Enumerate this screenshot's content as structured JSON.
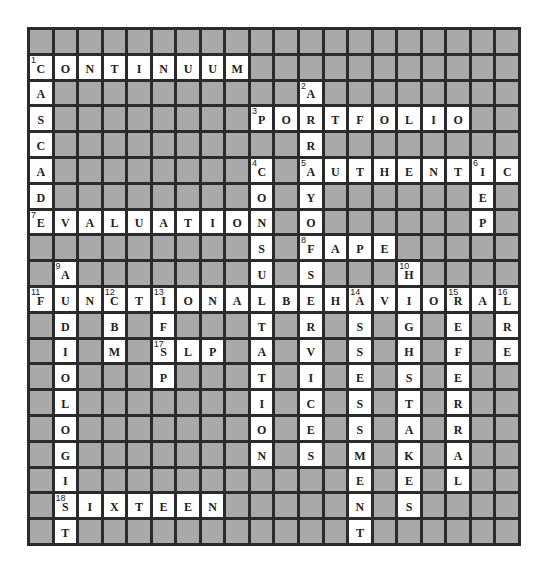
{
  "puzzle": {
    "rows": 20,
    "cols": 20,
    "colors": {
      "block": "#a9a9a9",
      "open": "#ffffff",
      "border": "#2b2b2b",
      "text": "#222222"
    },
    "grid": [
      "####################",
      "CONTINUUM###########",
      "A##########A########",
      "S########PORTFOLIO##",
      "C##########R########",
      "A########C#AUTHENTIC",
      "D########O#Y######E#",
      "EVALUATION#O######P#",
      "#########S#FAPE#####",
      "#A#######U#S###H####",
      "FUNCTIONALBEHAVIORAL",
      "#D#B#F###T#R#S#G#E#R",
      "#I#M#SLP#A#V#S#H#F#E",
      "#O###P###T#I#E#S#E##",
      "#L#######I#C#S#T#R##",
      "#O#######O#E#S#A#R##",
      "#G#######N#S#M#K#A##",
      "#I###########E#E#L##",
      "#SIXTEEN#####N#S####",
      "#T###########T######"
    ],
    "numbers": [
      {
        "n": "1",
        "r": 1,
        "c": 0
      },
      {
        "n": "2",
        "r": 2,
        "c": 11
      },
      {
        "n": "3",
        "r": 3,
        "c": 9
      },
      {
        "n": "4",
        "r": 5,
        "c": 9
      },
      {
        "n": "5",
        "r": 5,
        "c": 11
      },
      {
        "n": "6",
        "r": 5,
        "c": 18
      },
      {
        "n": "7",
        "r": 7,
        "c": 0
      },
      {
        "n": "8",
        "r": 8,
        "c": 11
      },
      {
        "n": "9",
        "r": 9,
        "c": 1
      },
      {
        "n": "10",
        "r": 9,
        "c": 15
      },
      {
        "n": "11",
        "r": 10,
        "c": 0
      },
      {
        "n": "12",
        "r": 10,
        "c": 3
      },
      {
        "n": "13",
        "r": 10,
        "c": 5
      },
      {
        "n": "14",
        "r": 10,
        "c": 13
      },
      {
        "n": "15",
        "r": 10,
        "c": 17
      },
      {
        "n": "16",
        "r": 10,
        "c": 19
      },
      {
        "n": "17",
        "r": 12,
        "c": 5
      },
      {
        "n": "18",
        "r": 18,
        "c": 1
      }
    ],
    "answers": {
      "across": [
        {
          "n": "1",
          "answer": "CONTINUUM"
        },
        {
          "n": "3",
          "answer": "PORTFOLIO"
        },
        {
          "n": "5",
          "answer": "AUTHENTIC"
        },
        {
          "n": "7",
          "answer": "EVALUATION"
        },
        {
          "n": "8",
          "answer": "FAPE"
        },
        {
          "n": "11",
          "answer": "FUNCTIONALBEHAVIORAL"
        },
        {
          "n": "17",
          "answer": "SLP"
        },
        {
          "n": "18",
          "answer": "SIXTEEN"
        }
      ],
      "down": [
        {
          "n": "1",
          "answer": "CASCAD"
        },
        {
          "n": "2",
          "answer": "ARRAYOFSERVICES"
        },
        {
          "n": "4",
          "answer": "CONSULTATION"
        },
        {
          "n": "6",
          "answer": "IEP"
        },
        {
          "n": "9",
          "answer": "AUDIOLOGIST"
        },
        {
          "n": "10",
          "answer": "HIGHSTAKES"
        },
        {
          "n": "12",
          "answer": "CBM"
        },
        {
          "n": "13",
          "answer": "IFSP"
        },
        {
          "n": "14",
          "answer": "ASSESSMENT"
        },
        {
          "n": "15",
          "answer": "REFERRAL"
        },
        {
          "n": "16",
          "answer": "LRE"
        }
      ]
    }
  }
}
